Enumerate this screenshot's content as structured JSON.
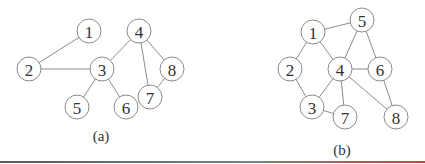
{
  "graphs": [
    {
      "caption": "(a)",
      "caption_pos": [
        101,
        141
      ],
      "node_radius": 12,
      "nodes": [
        {
          "id": "1",
          "label": "1",
          "x": 89,
          "y": 31
        },
        {
          "id": "2",
          "label": "2",
          "x": 29,
          "y": 69
        },
        {
          "id": "3",
          "label": "3",
          "x": 102,
          "y": 69
        },
        {
          "id": "4",
          "label": "4",
          "x": 139,
          "y": 31
        },
        {
          "id": "5",
          "label": "5",
          "x": 77,
          "y": 107
        },
        {
          "id": "6",
          "label": "6",
          "x": 126,
          "y": 107
        },
        {
          "id": "7",
          "label": "7",
          "x": 150,
          "y": 97
        },
        {
          "id": "8",
          "label": "8",
          "x": 172,
          "y": 69
        }
      ],
      "edges": [
        [
          "1",
          "2"
        ],
        [
          "2",
          "3"
        ],
        [
          "3",
          "4"
        ],
        [
          "3",
          "5"
        ],
        [
          "3",
          "6"
        ],
        [
          "4",
          "7"
        ],
        [
          "4",
          "8"
        ],
        [
          "7",
          "8"
        ]
      ]
    },
    {
      "caption": "(b)",
      "caption_pos": [
        342,
        155
      ],
      "node_radius": 12,
      "nodes": [
        {
          "id": "1",
          "label": "1",
          "x": 313,
          "y": 32
        },
        {
          "id": "5",
          "label": "5",
          "x": 362,
          "y": 20
        },
        {
          "id": "2",
          "label": "2",
          "x": 290,
          "y": 69
        },
        {
          "id": "4",
          "label": "4",
          "x": 340,
          "y": 69
        },
        {
          "id": "6",
          "label": "6",
          "x": 380,
          "y": 69
        },
        {
          "id": "3",
          "label": "3",
          "x": 312,
          "y": 107
        },
        {
          "id": "7",
          "label": "7",
          "x": 345,
          "y": 117
        },
        {
          "id": "8",
          "label": "8",
          "x": 396,
          "y": 117
        }
      ],
      "edges": [
        [
          "1",
          "5"
        ],
        [
          "1",
          "2"
        ],
        [
          "1",
          "4"
        ],
        [
          "5",
          "4"
        ],
        [
          "5",
          "6"
        ],
        [
          "2",
          "3"
        ],
        [
          "4",
          "6"
        ],
        [
          "4",
          "3"
        ],
        [
          "4",
          "7"
        ],
        [
          "4",
          "8"
        ],
        [
          "6",
          "8"
        ],
        [
          "3",
          "7"
        ]
      ]
    }
  ],
  "divider": {
    "y": 162,
    "color_left": "#5a5a5a",
    "color_mid": "#6f8a7a",
    "color_right": "#d04040"
  }
}
